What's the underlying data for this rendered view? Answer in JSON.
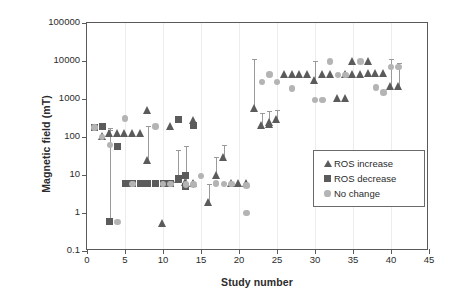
{
  "chart_data": {
    "type": "scatter",
    "title": "",
    "xlabel": "Study number",
    "ylabel": "Magnetic field (mT)",
    "yscale": "log",
    "ylim": [
      0.1,
      100000
    ],
    "xlim": [
      0,
      45
    ],
    "xticks": [
      0,
      5,
      10,
      15,
      20,
      25,
      30,
      35,
      40,
      45
    ],
    "yticks": [
      0.1,
      1,
      10,
      100,
      1000,
      10000,
      100000
    ],
    "ytick_labels": [
      "0.1",
      "1",
      "10",
      "100",
      "1000",
      "10000",
      "100000"
    ],
    "grid": false,
    "legend_position": "center-right",
    "colors": {
      "ros_increase": "#5b5b5b",
      "ros_decrease": "#5b5b5b",
      "no_change": "#b4b4b4",
      "error_bar": "#9a9a9a",
      "axis": "#5a5a5a"
    },
    "series": [
      {
        "name": "ROS increase",
        "marker": "triangle",
        "points": [
          {
            "x": 2,
            "y": 100
          },
          {
            "x": 3,
            "y": 120,
            "yhigh": 170
          },
          {
            "x": 4,
            "y": 120
          },
          {
            "x": 5,
            "y": 120
          },
          {
            "x": 6,
            "y": 120
          },
          {
            "x": 7,
            "y": 120
          },
          {
            "x": 8,
            "y": 23,
            "yhigh": 190
          },
          {
            "x": 8,
            "y": 470
          },
          {
            "x": 10,
            "y": 0.5
          },
          {
            "x": 11,
            "y": 180
          },
          {
            "x": 12,
            "y": 7,
            "yhigh": 45
          },
          {
            "x": 13,
            "y": 6,
            "yhigh": 57
          },
          {
            "x": 14,
            "y": 5.6
          },
          {
            "x": 14,
            "y": 260
          },
          {
            "x": 16,
            "y": 1.8,
            "yhigh": 5.7
          },
          {
            "x": 17,
            "y": 9,
            "yhigh": 30
          },
          {
            "x": 18,
            "y": 28,
            "yhigh": 60
          },
          {
            "x": 19,
            "y": 5.6
          },
          {
            "x": 20,
            "y": 5.6
          },
          {
            "x": 21,
            "y": 5.6
          },
          {
            "x": 22,
            "y": 530,
            "yhigh": 11000
          },
          {
            "x": 23,
            "y": 190,
            "yhigh": 430
          },
          {
            "x": 24,
            "y": 200,
            "yhigh": 480
          },
          {
            "x": 24,
            "y": 230
          },
          {
            "x": 25,
            "y": 270,
            "yhigh": 520
          },
          {
            "x": 26,
            "y": 4300
          },
          {
            "x": 27,
            "y": 4300
          },
          {
            "x": 28,
            "y": 4300
          },
          {
            "x": 29,
            "y": 4300
          },
          {
            "x": 30,
            "y": 2900,
            "yhigh": 10000
          },
          {
            "x": 31,
            "y": 4300
          },
          {
            "x": 32,
            "y": 4300
          },
          {
            "x": 33,
            "y": 950
          },
          {
            "x": 34,
            "y": 950
          },
          {
            "x": 34,
            "y": 4300
          },
          {
            "x": 35,
            "y": 4300
          },
          {
            "x": 35,
            "y": 9400
          },
          {
            "x": 36,
            "y": 4300
          },
          {
            "x": 37,
            "y": 4500
          },
          {
            "x": 37,
            "y": 9400
          },
          {
            "x": 38,
            "y": 4500
          },
          {
            "x": 39,
            "y": 4500
          },
          {
            "x": 40,
            "y": 2000,
            "yhigh": 11000
          },
          {
            "x": 41,
            "y": 2000,
            "yhigh": 9000
          }
        ]
      },
      {
        "name": "ROS decrease",
        "marker": "square",
        "points": [
          {
            "x": 1,
            "y": 180
          },
          {
            "x": 2,
            "y": 185
          },
          {
            "x": 3,
            "y": 0.58,
            "yhigh": 150
          },
          {
            "x": 4,
            "y": 57
          },
          {
            "x": 5,
            "y": 5.8
          },
          {
            "x": 6,
            "y": 5.8
          },
          {
            "x": 7,
            "y": 5.8
          },
          {
            "x": 8,
            "y": 5.8
          },
          {
            "x": 9,
            "y": 5.8
          },
          {
            "x": 10,
            "y": 5.8
          },
          {
            "x": 11,
            "y": 5.8
          },
          {
            "x": 12,
            "y": 290
          },
          {
            "x": 12,
            "y": 8
          },
          {
            "x": 13,
            "y": 10
          },
          {
            "x": 13,
            "y": 5
          },
          {
            "x": 14,
            "y": 195
          }
        ]
      },
      {
        "name": "No change",
        "marker": "circle",
        "points": [
          {
            "x": 1,
            "y": 180
          },
          {
            "x": 2,
            "y": 100
          },
          {
            "x": 3,
            "y": 62
          },
          {
            "x": 4,
            "y": 0.58
          },
          {
            "x": 5,
            "y": 310
          },
          {
            "x": 6,
            "y": 5.8
          },
          {
            "x": 9,
            "y": 190
          },
          {
            "x": 10,
            "y": 5.8
          },
          {
            "x": 11,
            "y": 5.8
          },
          {
            "x": 13,
            "y": 5.6
          },
          {
            "x": 14,
            "y": 5.6
          },
          {
            "x": 15,
            "y": 9.5
          },
          {
            "x": 17,
            "y": 6
          },
          {
            "x": 18,
            "y": 5.8
          },
          {
            "x": 19,
            "y": 5.8
          },
          {
            "x": 21,
            "y": 1.0
          },
          {
            "x": 21,
            "y": 5.2
          },
          {
            "x": 23,
            "y": 2800
          },
          {
            "x": 24,
            "y": 4400
          },
          {
            "x": 25,
            "y": 2800
          },
          {
            "x": 27,
            "y": 1900
          },
          {
            "x": 30,
            "y": 950
          },
          {
            "x": 31,
            "y": 950
          },
          {
            "x": 32,
            "y": 9800
          },
          {
            "x": 33,
            "y": 4300
          },
          {
            "x": 34,
            "y": 4300
          },
          {
            "x": 36,
            "y": 9700
          },
          {
            "x": 38,
            "y": 2000
          },
          {
            "x": 39,
            "y": 1500
          },
          {
            "x": 40,
            "y": 6900
          },
          {
            "x": 41,
            "y": 6900
          }
        ]
      }
    ]
  },
  "legend": {
    "items": [
      {
        "label": "ROS increase",
        "marker": "triangle-icon"
      },
      {
        "label": "ROS decrease",
        "marker": "square-icon"
      },
      {
        "label": "No change",
        "marker": "circle-icon"
      }
    ]
  }
}
